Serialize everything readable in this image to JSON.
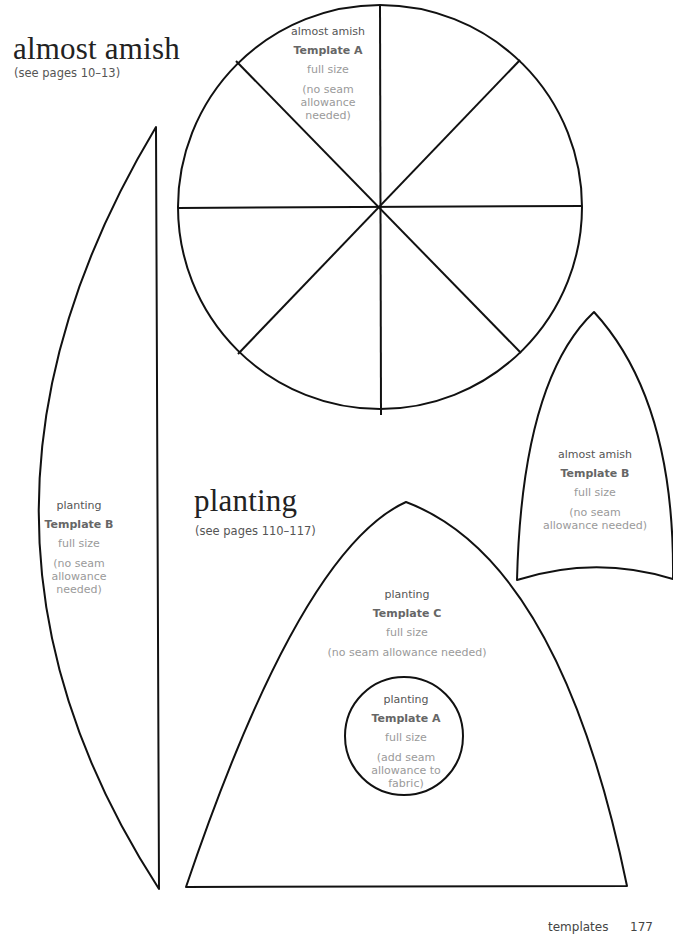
{
  "sections": {
    "almost_amish": {
      "title": "almost amish",
      "pages_ref": "(see pages 10–13)"
    },
    "planting": {
      "title": "planting",
      "pages_ref": "(see pages 110–117)"
    }
  },
  "templates": {
    "almost_amish_a": {
      "project": "almost amish",
      "name": "Template A",
      "size": "full size",
      "note": "(no seam allowance needed)",
      "note_lines": [
        "(no seam",
        "allowance",
        "needed)"
      ],
      "shape": "circle divided into 8 wedges"
    },
    "almost_amish_b": {
      "project": "almost amish",
      "name": "Template B",
      "size": "full size",
      "note_lines": [
        "(no seam",
        "allowance needed)"
      ],
      "shape": "pointed arch"
    },
    "planting_b": {
      "project": "planting",
      "name": "Template B",
      "size": "full size",
      "note_lines": [
        "(no seam",
        "allowance",
        "needed)"
      ],
      "shape": "half-lens"
    },
    "planting_c": {
      "project": "planting",
      "name": "Template C",
      "size": "full size",
      "note_lines": [
        "(no seam allowance needed)"
      ],
      "shape": "tall pointed arch"
    },
    "planting_a": {
      "project": "planting",
      "name": "Template A",
      "size": "full size",
      "note_lines": [
        "(add seam",
        "allowance to",
        "fabric)"
      ],
      "shape": "circle"
    }
  },
  "footer": {
    "section": "templates",
    "page_number": "177"
  },
  "colors": {
    "outline": "#111111",
    "title_text": "#222222",
    "bold_label": "#666666",
    "light_label": "#9a9a9a"
  }
}
